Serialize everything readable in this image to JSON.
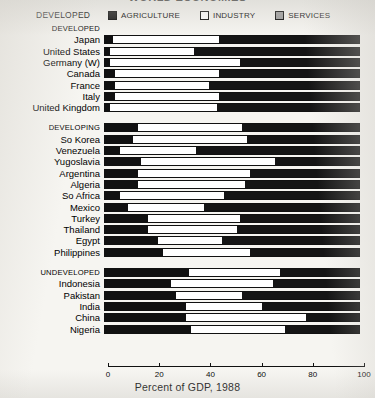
{
  "title": "WORLD ECONOMIES",
  "legend": {
    "group_label": "DEVELOPED",
    "items": [
      {
        "label": "AGRICULTURE",
        "swatch": "agriculture-swatch-icon",
        "color": "#111111"
      },
      {
        "label": "INDUSTRY",
        "swatch": "industry-swatch-icon",
        "color": "#ffffff"
      },
      {
        "label": "SERVICES",
        "swatch": "services-swatch-icon",
        "color": "#9a9a9a"
      }
    ]
  },
  "axis": {
    "title": "Percent of GDP, 1988",
    "ticks": [
      "0",
      "20",
      "40",
      "60",
      "80",
      "100"
    ],
    "min": 0,
    "max": 100
  },
  "chart_data": {
    "type": "bar",
    "orientation": "horizontal",
    "stacked": true,
    "title": "WORLD ECONOMIES",
    "xlabel": "Percent of GDP, 1988",
    "ylabel": "",
    "xlim": [
      0,
      100
    ],
    "grid": false,
    "legend_position": "top",
    "series": [
      {
        "name": "AGRICULTURE",
        "color": "#111111"
      },
      {
        "name": "INDUSTRY",
        "color": "#ffffff"
      },
      {
        "name": "SERVICES",
        "color": "#9a9a9a"
      }
    ],
    "groups": [
      {
        "name": "DEVELOPED",
        "is_section_header": true,
        "has_bar": false,
        "rows": [
          {
            "label": "Japan",
            "agriculture": 3,
            "industry": 42,
            "services": 55
          },
          {
            "label": "United States",
            "agriculture": 2,
            "industry": 33,
            "services": 65
          },
          {
            "label": "Germany (W)",
            "agriculture": 2,
            "industry": 51,
            "services": 47
          },
          {
            "label": "Canada",
            "agriculture": 4,
            "industry": 41,
            "services": 55
          },
          {
            "label": "France",
            "agriculture": 4,
            "industry": 37,
            "services": 59
          },
          {
            "label": "Italy",
            "agriculture": 4,
            "industry": 41,
            "services": 55
          },
          {
            "label": "United Kingdom",
            "agriculture": 2,
            "industry": 42,
            "services": 56
          }
        ]
      },
      {
        "name": "DEVELOPING",
        "is_section_header": true,
        "has_bar": true,
        "section_bar": {
          "agriculture": 13,
          "industry": 41,
          "services": 46
        },
        "rows": [
          {
            "label": "So Korea",
            "agriculture": 11,
            "industry": 45,
            "services": 44
          },
          {
            "label": "Venezuela",
            "agriculture": 6,
            "industry": 30,
            "services": 64
          },
          {
            "label": "Yugoslavia",
            "agriculture": 14,
            "industry": 53,
            "services": 33
          },
          {
            "label": "Argentina",
            "agriculture": 13,
            "industry": 44,
            "services": 43
          },
          {
            "label": "Algeria",
            "agriculture": 13,
            "industry": 42,
            "services": 45
          },
          {
            "label": "So Africa",
            "agriculture": 6,
            "industry": 41,
            "services": 53
          },
          {
            "label": "Mexico",
            "agriculture": 9,
            "industry": 30,
            "services": 61
          },
          {
            "label": "Turkey",
            "agriculture": 17,
            "industry": 36,
            "services": 47
          },
          {
            "label": "Thailand",
            "agriculture": 17,
            "industry": 35,
            "services": 48
          },
          {
            "label": "Egypt",
            "agriculture": 21,
            "industry": 25,
            "services": 54
          },
          {
            "label": "Philippines",
            "agriculture": 23,
            "industry": 34,
            "services": 43
          }
        ]
      },
      {
        "name": "UNDEVELOPED",
        "is_section_header": true,
        "has_bar": true,
        "section_bar": {
          "agriculture": 33,
          "industry": 36,
          "services": 31
        },
        "rows": [
          {
            "label": "Indonesia",
            "agriculture": 26,
            "industry": 40,
            "services": 34
          },
          {
            "label": "Pakistan",
            "agriculture": 28,
            "industry": 26,
            "services": 46
          },
          {
            "label": "India",
            "agriculture": 32,
            "industry": 30,
            "services": 38
          },
          {
            "label": "China",
            "agriculture": 32,
            "industry": 47,
            "services": 21
          },
          {
            "label": "Nigeria",
            "agriculture": 34,
            "industry": 37,
            "services": 29
          }
        ]
      }
    ]
  }
}
